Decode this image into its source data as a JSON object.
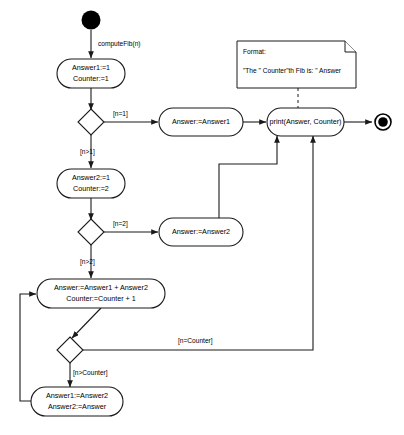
{
  "diagram": {
    "type": "uml-activity-diagram",
    "colors": {
      "stroke": "#1a1a1a",
      "fill": "#ffffff",
      "text": "#000000"
    }
  },
  "nodes": {
    "start": {
      "name": "initial-node"
    },
    "act_init": {
      "line1": "Answer1:=1",
      "line2": "Counter:=1"
    },
    "act_ans1": {
      "line1": "Answer:=Answer1"
    },
    "act_init2": {
      "line1": "Answer2:=1",
      "line2": "Counter:=2"
    },
    "act_ans2": {
      "line1": "Answer:=Answer2"
    },
    "act_sum": {
      "line1": "Answer:=Answer1 + Answer2",
      "line2": "Counter:=Counter + 1"
    },
    "act_shift": {
      "line1": "Answer1:=Answer2",
      "line2": "Answer2:=Answer"
    },
    "act_print": {
      "line1": "print(Answer, Counter)"
    },
    "end": {
      "name": "final-node"
    }
  },
  "edges": {
    "start_label": "computeFib(n)",
    "g_n_eq_1": "[n=1]",
    "g_n_gt_1": "[n>1]",
    "g_n_eq_2": "[n=2]",
    "g_n_gt_2": "[n>2]",
    "g_n_eq_counter": "[n=Counter]",
    "g_n_gt_counter": "[n>Counter]"
  },
  "note": {
    "line1": "Format:",
    "line2": "\"The \" Counter\"th Fib is: \" Answer"
  }
}
